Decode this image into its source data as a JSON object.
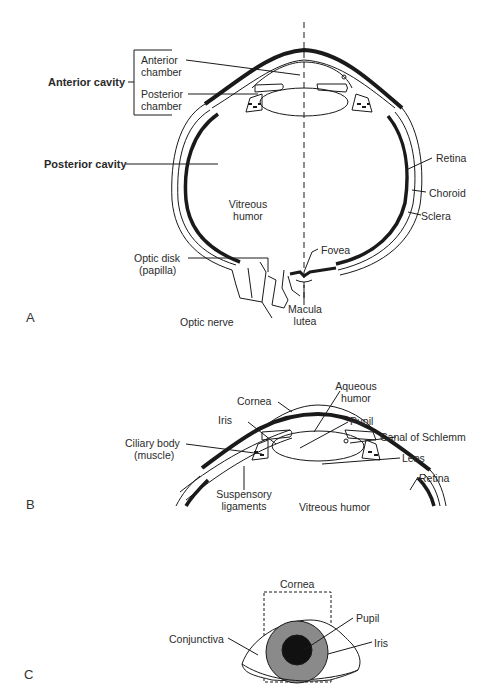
{
  "panels": {
    "a": {
      "letter": "A",
      "labels": {
        "anterior_cavity": "Anterior cavity",
        "anterior_chamber_1": "Anterior",
        "anterior_chamber_2": "chamber",
        "posterior_chamber_1": "Posterior",
        "posterior_chamber_2": "chamber",
        "posterior_cavity": "Posterior cavity",
        "vitreous_1": "Vitreous",
        "vitreous_2": "humor",
        "retina": "Retina",
        "choroid": "Choroid",
        "sclera": "Sclera",
        "optic_disk_1": "Optic  disk",
        "optic_disk_2": "(papilla)",
        "fovea": "Fovea",
        "optic_nerve": "Optic  nerve",
        "macula_1": "Macula",
        "macula_2": "lutea"
      }
    },
    "b": {
      "letter": "B",
      "labels": {
        "cornea": "Cornea",
        "aqueous_1": "Aqueous",
        "aqueous_2": "humor",
        "iris": "Iris",
        "pupil": "Pupil",
        "canal": "Canal  of  Schlemm",
        "ciliary_1": "Ciliary body",
        "ciliary_2": "(muscle)",
        "lens": "Lens",
        "retina": "Retina",
        "suspensory_1": "Suspensory",
        "suspensory_2": "ligaments",
        "vitreous": "Vitreous humor"
      }
    },
    "c": {
      "letter": "C",
      "labels": {
        "cornea": "Cornea",
        "pupil": "Pupil",
        "conjunctiva": "Conjunctiva",
        "iris": "Iris"
      }
    }
  },
  "colors": {
    "line": "#1a1a1a",
    "iris_fill": "#8a8a8a",
    "pupil_fill": "#111111"
  }
}
